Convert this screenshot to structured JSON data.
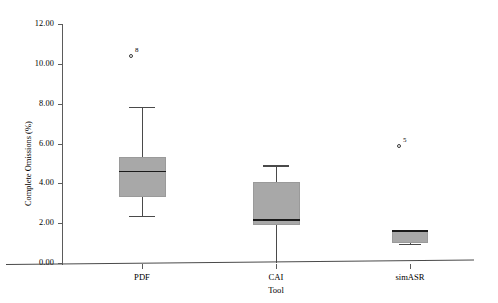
{
  "chart_data": {
    "type": "box",
    "title": "",
    "xlabel": "Tool",
    "ylabel": "Complete Omissions (%)",
    "categories": [
      "PDF",
      "CAI",
      "simASR"
    ],
    "ylim": [
      0.0,
      12.0
    ],
    "ytick_values": [
      0.0,
      2.0,
      4.0,
      6.0,
      8.0,
      10.0,
      12.0
    ],
    "ytick_labels": [
      "0.00",
      "2.00",
      "4.00",
      "6.00",
      "8.00",
      "10.00",
      "12.00"
    ],
    "grid": false,
    "legend": "none",
    "box_fill_color": "#a8a8a8",
    "median_color": "#1a1a1a",
    "axis_color": "#4a4a4a",
    "boxes": [
      {
        "category": "PDF",
        "whisker_low": 2.35,
        "q1": 3.3,
        "median": 4.6,
        "q3": 5.32,
        "whisker_high": 7.82,
        "outliers": [
          {
            "value": 10.4,
            "label": "8"
          }
        ]
      },
      {
        "category": "CAI",
        "whisker_low": 0.0,
        "q1": 1.9,
        "median": 2.15,
        "q3": 4.05,
        "whisker_high": 4.9,
        "outliers": []
      },
      {
        "category": "simASR",
        "whisker_low": 0.95,
        "q1": 0.98,
        "median": 1.62,
        "q3": 1.66,
        "whisker_high": 1.66,
        "outliers": [
          {
            "value": 5.85,
            "label": "5"
          }
        ]
      }
    ]
  }
}
